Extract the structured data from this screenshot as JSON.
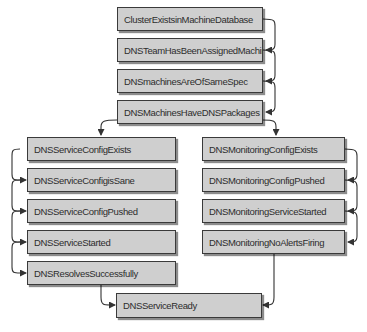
{
  "diagram": {
    "colors": {
      "box_fill": "#cfcfcf",
      "box_border": "#3a3a3a",
      "text": "#2d2d2d",
      "arrow": "#333333",
      "background": "#ffffff"
    },
    "nodes": {
      "top": [
        {
          "id": "n1",
          "label": "ClusterExistsinMachineDatabase"
        },
        {
          "id": "n2",
          "label": "DNSTeamHasBeenAssignedMachines"
        },
        {
          "id": "n3",
          "label": "DNSmachinesAreOfSameSpec"
        },
        {
          "id": "n4",
          "label": "DNSMachinesHaveDNSPackages"
        }
      ],
      "left": [
        {
          "id": "l1",
          "label": "DNSServiceConfigExists"
        },
        {
          "id": "l2",
          "label": "DNSServiceConfigisSane"
        },
        {
          "id": "l3",
          "label": "DNSServiceConfigPushed"
        },
        {
          "id": "l4",
          "label": "DNSServiceStarted"
        },
        {
          "id": "l5",
          "label": "DNSResolvesSuccessfully"
        }
      ],
      "right": [
        {
          "id": "r1",
          "label": "DNSMonitoringConfigExists"
        },
        {
          "id": "r2",
          "label": "DNSMonitoringConfigPushed"
        },
        {
          "id": "r3",
          "label": "DNSMonitoringServiceStarted"
        },
        {
          "id": "r4",
          "label": "DNSMonitoringNoAlertsFiring"
        }
      ],
      "final": {
        "id": "f1",
        "label": "DNSServiceReady"
      }
    },
    "edges": [
      [
        "ClusterExistsinMachineDatabase",
        "DNSTeamHasBeenAssignedMachines"
      ],
      [
        "DNSTeamHasBeenAssignedMachines",
        "DNSmachinesAreOfSameSpec"
      ],
      [
        "DNSmachinesAreOfSameSpec",
        "DNSMachinesHaveDNSPackages"
      ],
      [
        "DNSMachinesHaveDNSPackages",
        "DNSServiceConfigExists"
      ],
      [
        "DNSMachinesHaveDNSPackages",
        "DNSMonitoringConfigExists"
      ],
      [
        "DNSServiceConfigExists",
        "DNSServiceConfigisSane"
      ],
      [
        "DNSServiceConfigisSane",
        "DNSServiceConfigPushed"
      ],
      [
        "DNSServiceConfigPushed",
        "DNSServiceStarted"
      ],
      [
        "DNSServiceStarted",
        "DNSResolvesSuccessfully"
      ],
      [
        "DNSResolvesSuccessfully",
        "DNSServiceReady"
      ],
      [
        "DNSMonitoringConfigExists",
        "DNSMonitoringConfigPushed"
      ],
      [
        "DNSMonitoringConfigPushed",
        "DNSMonitoringServiceStarted"
      ],
      [
        "DNSMonitoringServiceStarted",
        "DNSMonitoringNoAlertsFiring"
      ],
      [
        "DNSMonitoringNoAlertsFiring",
        "DNSServiceReady"
      ]
    ]
  }
}
